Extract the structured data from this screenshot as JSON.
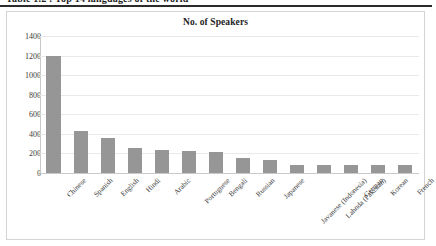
{
  "page": {
    "clipped_header_text": "Table 1.2 : Top 14 languages of the world"
  },
  "chart": {
    "title": "No. of Speakers"
  },
  "chart_data": {
    "type": "bar",
    "title": "No. of Speakers",
    "xlabel": "",
    "ylabel": "",
    "ylim": [
      0,
      1400
    ],
    "ytick_labels": [
      "1400",
      "1200",
      "1000",
      "800",
      "600",
      "400",
      "200",
      "0"
    ],
    "yticks": [
      1400,
      1200,
      1000,
      800,
      600,
      400,
      200,
      0
    ],
    "grid": true,
    "legend": false,
    "bar_color": "#969696",
    "categories": [
      "Chinese",
      "Spanish",
      "English",
      "Hindi",
      "Arabic",
      "Portuguese",
      "Bengali",
      "Russian",
      "Japanese",
      "Javanese (Indonesia)",
      "Lahnda (Pakistan)",
      "German",
      "Korean",
      "French"
    ],
    "values": [
      1200,
      430,
      360,
      260,
      240,
      220,
      210,
      150,
      130,
      85,
      85,
      80,
      80,
      80
    ]
  }
}
